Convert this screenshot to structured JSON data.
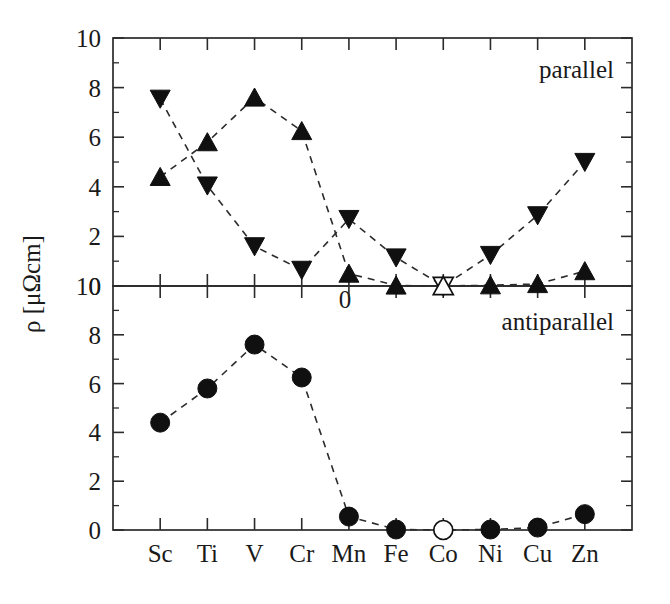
{
  "figure": {
    "y_axis_title": "ρ [μΩcm]",
    "y_axis_title_parts": {
      "symbol": "ρ",
      "unit": "[μΩcm]"
    },
    "background_color": "#ffffff",
    "ink_color": "#101010"
  },
  "panels": [
    {
      "id": "parallel",
      "label": "parallel",
      "y_ticks_major": [
        "0",
        "2",
        "4",
        "6",
        "8",
        "10"
      ],
      "zero_label_below": "0"
    },
    {
      "id": "antiparallel",
      "label": "antiparallel",
      "y_ticks_major": [
        "0",
        "2",
        "4",
        "6",
        "8",
        "10"
      ]
    }
  ],
  "x_categories": [
    "Sc",
    "Ti",
    "V",
    "Cr",
    "Mn",
    "Fe",
    "Co",
    "Ni",
    "Cu",
    "Zn"
  ],
  "chart_data": [
    {
      "type": "line",
      "title": "parallel",
      "panel": "parallel",
      "xlabel": "",
      "ylabel": "ρ [μΩcm]",
      "ylim": [
        0,
        10
      ],
      "yticks": [
        0,
        2,
        4,
        6,
        8,
        10
      ],
      "grid": false,
      "legend": "none",
      "categories": [
        "Sc",
        "Ti",
        "V",
        "Cr",
        "Mn",
        "Fe",
        "Co",
        "Ni",
        "Cu",
        "Zn"
      ],
      "series": [
        {
          "name": "down-triangle",
          "marker": "triangle-down-filled",
          "linestyle": "dashed",
          "values": [
            7.55,
            4.05,
            1.6,
            0.65,
            2.7,
            1.15,
            0.0,
            1.25,
            2.85,
            5.0
          ],
          "open_marker_indices": [
            6
          ]
        },
        {
          "name": "up-triangle",
          "marker": "triangle-up-filled",
          "linestyle": "dashed",
          "values": [
            4.4,
            5.8,
            7.6,
            6.25,
            0.5,
            0.02,
            0.0,
            0.03,
            0.08,
            0.6
          ],
          "open_marker_indices": [
            6
          ]
        }
      ]
    },
    {
      "type": "line",
      "title": "antiparallel",
      "panel": "antiparallel",
      "xlabel": "",
      "ylabel": "ρ [μΩcm]",
      "ylim": [
        0,
        10
      ],
      "yticks": [
        0,
        2,
        4,
        6,
        8,
        10
      ],
      "grid": false,
      "legend": "none",
      "categories": [
        "Sc",
        "Ti",
        "V",
        "Cr",
        "Mn",
        "Fe",
        "Co",
        "Ni",
        "Cu",
        "Zn"
      ],
      "series": [
        {
          "name": "circle",
          "marker": "circle-filled",
          "linestyle": "dashed",
          "values": [
            4.4,
            5.8,
            7.6,
            6.25,
            0.55,
            0.02,
            0.0,
            0.02,
            0.1,
            0.65
          ],
          "open_marker_indices": [
            6
          ]
        }
      ]
    }
  ]
}
